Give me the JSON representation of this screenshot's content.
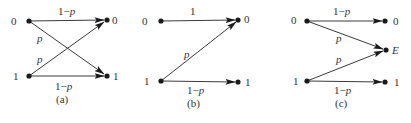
{
  "figure": {
    "panels": [
      {
        "id": "a",
        "caption": "(a)",
        "name": "binary-symmetric-channel",
        "inputs": [
          "0",
          "1"
        ],
        "outputs": [
          "0",
          "1"
        ],
        "edges": [
          {
            "from": "0",
            "to": "0",
            "label": "1−p"
          },
          {
            "from": "0",
            "to": "1",
            "label": "p"
          },
          {
            "from": "1",
            "to": "0",
            "label": "p"
          },
          {
            "from": "1",
            "to": "1",
            "label": "1−p"
          }
        ]
      },
      {
        "id": "b",
        "caption": "(b)",
        "name": "z-channel",
        "inputs": [
          "0",
          "1"
        ],
        "outputs": [
          "0",
          "1"
        ],
        "edges": [
          {
            "from": "0",
            "to": "0",
            "label": "1"
          },
          {
            "from": "1",
            "to": "0",
            "label": "p"
          },
          {
            "from": "1",
            "to": "1",
            "label": "1−p"
          }
        ]
      },
      {
        "id": "c",
        "caption": "(c)",
        "name": "binary-erasure-channel",
        "inputs": [
          "0",
          "1"
        ],
        "outputs": [
          "0",
          "E",
          "1"
        ],
        "edges": [
          {
            "from": "0",
            "to": "0",
            "label": "1−p"
          },
          {
            "from": "0",
            "to": "E",
            "label": "p"
          },
          {
            "from": "1",
            "to": "E",
            "label": "p"
          },
          {
            "from": "1",
            "to": "1",
            "label": "1−p"
          }
        ]
      }
    ]
  },
  "labels": {
    "a": {
      "in0": "0",
      "in1": "1",
      "out0": "0",
      "out1": "1",
      "e00_one": "1−",
      "e00_p": "p",
      "e01_p": "p",
      "e10_p": "p",
      "e11_one": "1−",
      "e11_p": "p",
      "caption": "(a)"
    },
    "b": {
      "in0": "0",
      "in1": "1",
      "out0": "0",
      "out1": "1",
      "e00": "1",
      "e10_p": "p",
      "e11_one": "1−",
      "e11_p": "p",
      "caption": "(b)"
    },
    "c": {
      "in0": "0",
      "in1": "1",
      "out0": "0",
      "outE": "E",
      "out1": "1",
      "e00_one": "1−",
      "e00_p": "p",
      "e0E_p": "p",
      "e1E_p": "p",
      "e11_one": "1−",
      "e11_p": "p",
      "caption": "(c)"
    }
  }
}
